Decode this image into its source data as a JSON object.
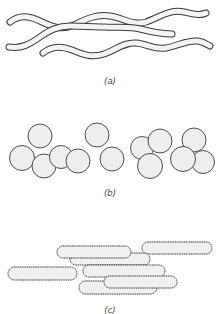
{
  "figure": {
    "panels": [
      {
        "id": "a",
        "label": "(a)",
        "shape": "spiral"
      },
      {
        "id": "b",
        "label": "(b)",
        "shape": "sphere"
      },
      {
        "id": "c",
        "label": "(c)",
        "shape": "rod"
      }
    ],
    "colors": {
      "outline": "#333333",
      "fill": "#f2f2f2",
      "background": "#ffffff"
    }
  }
}
